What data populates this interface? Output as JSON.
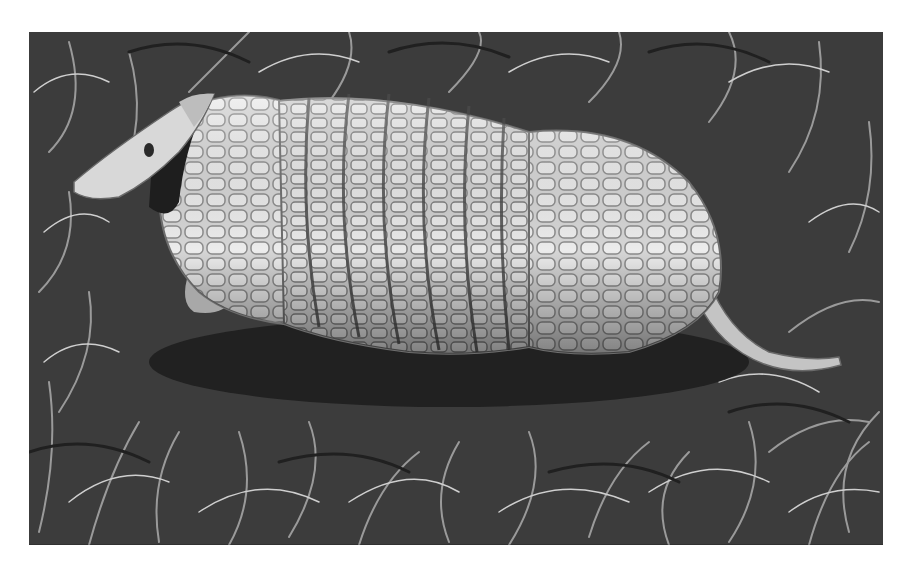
{
  "image": {
    "subject": "Armadillo in grass",
    "description": "Black-and-white photograph of an armadillo with banded armor shell standing in grass, head to the left, tail to the right",
    "style": "monochrome photograph",
    "colors": {
      "background": "#ffffff",
      "grass_dark": "#2e2e2e",
      "grass_mid": "#6a6a6a",
      "grass_light": "#c8c8c8",
      "shell_light": "#dcdcdc",
      "shell_shadow": "#8a8a8a"
    }
  }
}
